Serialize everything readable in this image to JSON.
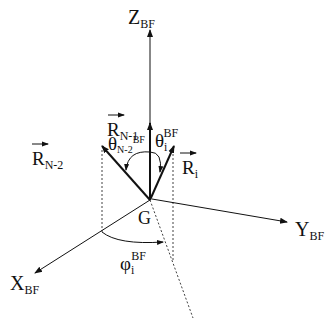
{
  "diagram": {
    "origin": {
      "label": "G"
    },
    "axes": {
      "z": {
        "base": "Z",
        "sub": "BF"
      },
      "y": {
        "base": "Y",
        "sub": "BF"
      },
      "x": {
        "base": "X",
        "sub": "BF"
      }
    },
    "vectors": {
      "r_n1": {
        "base": "R",
        "sub": "N-1"
      },
      "r_n2": {
        "base": "R",
        "sub": "N-2"
      },
      "r_i": {
        "base": "R",
        "sub": "i"
      }
    },
    "angles": {
      "theta_n2": {
        "base": "θ",
        "sub": "N-2",
        "sup": "BF"
      },
      "theta_i": {
        "base": "θ",
        "sub": "i",
        "sup": "BF"
      },
      "phi_i": {
        "base": "φ",
        "sub": "i",
        "sup": "BF"
      }
    },
    "colors": {
      "line": "#111111",
      "background": "#ffffff"
    }
  }
}
